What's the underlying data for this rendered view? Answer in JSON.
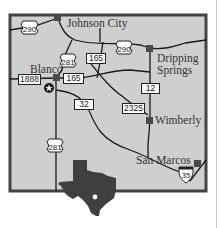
{
  "map": {
    "title": "Hill Country area map",
    "colors": {
      "land": "#cfcfcf",
      "border": "#444444",
      "road": "#1a1a1a",
      "town_marker": "#4a4a4a",
      "inset_state": "#3f3f3f"
    },
    "towns": [
      {
        "name": "Johnson City",
        "label": "Johnson City"
      },
      {
        "name": "Blanco",
        "label": "Blanco"
      },
      {
        "name": "Dripping Springs",
        "label_line1": "Dripping",
        "label_line2": "Springs"
      },
      {
        "name": "Wimberly",
        "label": "Wimberly"
      },
      {
        "name": "San Marcos",
        "label": "San Marcos"
      }
    ],
    "routes": {
      "us290_west": "290",
      "us290_east": "290",
      "us281_north": "281",
      "us281_south": "281",
      "rm165_north": "165",
      "rm165_west": "165",
      "rm1888": "1888",
      "rm32": "32",
      "rm2325": "2325",
      "rm12": "12",
      "i35": "35"
    },
    "marker": {
      "type": "star",
      "meaning": "featured location near Blanco"
    },
    "inset": {
      "state": "Texas",
      "dot": "location marker"
    }
  }
}
